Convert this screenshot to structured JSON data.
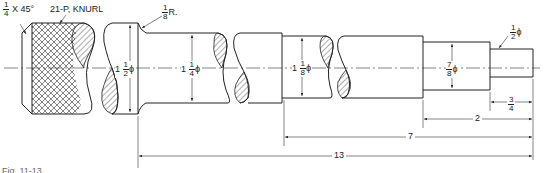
{
  "drawing": {
    "type": "stepped shaft detail drawing",
    "callouts": {
      "chamfer": {
        "fraction_num": "1",
        "fraction_den": "4",
        "suffix": "X 45°"
      },
      "knurl": "21-P, KNURL",
      "fillet": {
        "fraction_num": "1",
        "fraction_den": "8",
        "suffix": "R."
      }
    },
    "diameters": [
      {
        "whole": "1",
        "fraction_num": "1",
        "fraction_den": "2",
        "symbol": "ϕ"
      },
      {
        "whole": "1",
        "fraction_num": "1",
        "fraction_den": "4",
        "symbol": "ϕ"
      },
      {
        "whole": "1",
        "fraction_num": "1",
        "fraction_den": "8",
        "symbol": "ϕ"
      },
      {
        "whole": "",
        "fraction_num": "7",
        "fraction_den": "8",
        "symbol": "ϕ"
      },
      {
        "whole": "",
        "fraction_num": "1",
        "fraction_den": "2",
        "symbol": "ϕ"
      }
    ],
    "lengths": [
      {
        "id": "end",
        "fraction_num": "3",
        "fraction_den": "4"
      },
      {
        "id": "step",
        "value": "2"
      },
      {
        "id": "middle",
        "value": "7"
      },
      {
        "id": "overall",
        "value": "13"
      }
    ],
    "caption": "Fig. 11-13"
  }
}
